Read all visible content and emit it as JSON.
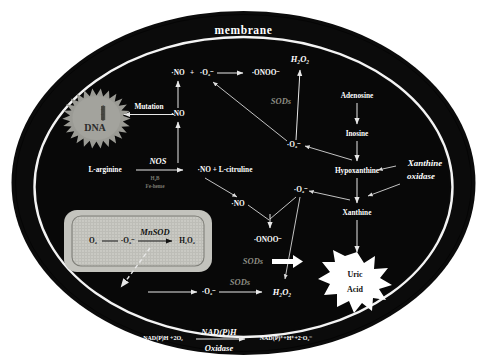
{
  "figure": {
    "membrane_label": "membrane",
    "background_color": "#ffffff",
    "cell_fill": "#0a0a0a",
    "membrane_ring_color": "#f2f2f2",
    "enzyme_label_color": "#8e8e84",
    "text_color": "#ffffff"
  },
  "organelles": {
    "nucleus": {
      "label": "DNA",
      "nucleolus_label": "nucleolus",
      "fill": "#9a9a94",
      "shape": "starburst"
    },
    "mitochondrion": {
      "fill": "#c8c8c2",
      "reaction": {
        "substrate": "O₂",
        "intermediate": "·O₂⁻",
        "enzyme": "MnSOD",
        "product": "H₂O₂"
      }
    },
    "uric_acid_burst": {
      "line1": "Uric",
      "line2": "Acid",
      "fill": "#ffffff",
      "shape": "starburst"
    }
  },
  "species": {
    "no_top": "·NO",
    "o2_minus_top": "·O₂⁻",
    "onoo_top": "·ONOO⁻",
    "h2o2_top": "H₂O₂",
    "no_mutation": "·NO",
    "l_arginine": "L-arginine",
    "no_citrulline": "·NO + L-citruline",
    "no_mid": "·NO",
    "onoo_mid": "·ONOO⁻",
    "o2_minus_mid_left": "·O₂⁻",
    "o2_minus_mid_right": "·O₂⁻",
    "o2_minus_bottom": "·O₂⁻",
    "h2o2_bottom": "H₂O₂",
    "o2_minus_upper_right": "·O₂⁻"
  },
  "enzymes": {
    "nos": "NOS",
    "nos_cofactor_1": "H₄B",
    "nos_cofactor_2": "Fe-heme",
    "sods_top": "SODs",
    "sods_mid": "SODs",
    "sods_bottom": "SODs",
    "mnsod": "MnSOD",
    "xanthine_oxidase_line1": "Xanthine",
    "xanthine_oxidase_line2": "oxidase",
    "nadph_oxidase_line1": "NAD(P)H",
    "nadph_oxidase_line2": "Oxidase"
  },
  "purine_pathway": {
    "steps": [
      "Adenosine",
      "Inosine",
      "Hypoxanthine",
      "Xanthine"
    ],
    "product": "Uric Acid"
  },
  "annotations": {
    "mutation": "Mutation"
  },
  "bottom_equation": {
    "left": "NAD(P)H +2O₂",
    "right": "NAD(P)⁺+H⁺+2·O₂⁻"
  }
}
